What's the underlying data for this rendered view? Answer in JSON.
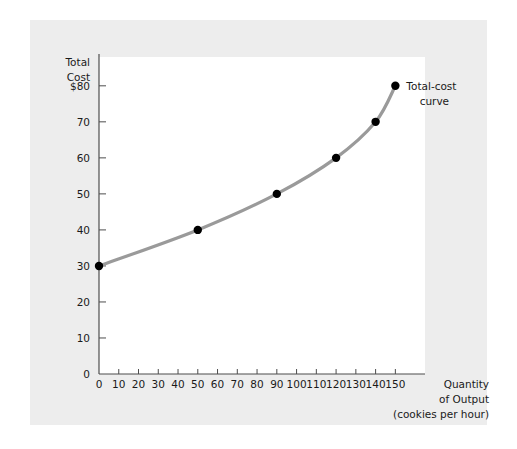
{
  "figure": {
    "panel_color": "#ededed",
    "plot_background": "#ffffff",
    "axis_color": "#4d4d4d",
    "text_color": "#1a1a1a"
  },
  "chart_data": {
    "type": "line",
    "title": "",
    "subtitle": "",
    "ylabel_lines": [
      "Total",
      "Cost"
    ],
    "xlabel_lines": [
      "Quantity",
      "of Output",
      "(cookies per hour)"
    ],
    "xlabel": "Quantity of Output (cookies per hour)",
    "ylabel": "Total Cost",
    "series": [
      {
        "name": "Total-cost curve",
        "color": "#9a9a9a",
        "marker_color": "#000000",
        "x": [
          0,
          50,
          90,
          120,
          140,
          150
        ],
        "values": [
          30,
          40,
          50,
          60,
          70,
          80
        ]
      }
    ],
    "annotations": [
      {
        "name": "total-cost-curve-label",
        "text_lines": [
          "Total-cost",
          "curve"
        ],
        "text": "Total-cost curve",
        "at_x": 150,
        "at_y": 80
      }
    ],
    "xticks": [
      0,
      10,
      20,
      30,
      40,
      50,
      60,
      70,
      80,
      90,
      100,
      110,
      120,
      130,
      140,
      150
    ],
    "xticklabels": [
      "0",
      "10",
      "20",
      "30",
      "40",
      "50",
      "60",
      "70",
      "80",
      "90",
      "100",
      "110",
      "120",
      "130",
      "140",
      "150"
    ],
    "yticks": [
      0,
      10,
      20,
      30,
      40,
      50,
      60,
      70,
      80
    ],
    "yticklabels": [
      "0",
      "10",
      "20",
      "30",
      "40",
      "50",
      "60",
      "70",
      "$80"
    ],
    "xlim": [
      0,
      165
    ],
    "ylim": [
      0,
      88
    ],
    "grid": false,
    "legend": "none"
  }
}
